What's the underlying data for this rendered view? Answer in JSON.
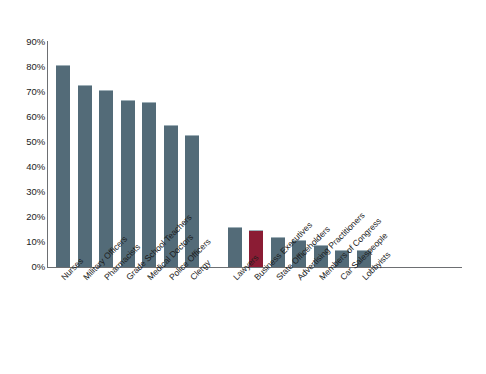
{
  "chart_data": {
    "type": "bar",
    "title": "",
    "subtitle": "",
    "xlabel": "",
    "ylabel": "",
    "ylim": [
      0,
      90
    ],
    "ytick_labels": [
      "90%",
      "80%",
      "70%",
      "60%",
      "50%",
      "40%",
      "30%",
      "20%",
      "10%",
      "0%"
    ],
    "ytick_values": [
      90,
      80,
      70,
      60,
      50,
      40,
      30,
      20,
      10,
      0
    ],
    "grid": false,
    "legend": "none",
    "categories": [
      "Nurses",
      "Military Officers",
      "Pharmacists",
      "Grade School Teachers",
      "Medical Doctors",
      "Police Officers",
      "Clergy",
      "Lawyers",
      "Business Executives",
      "State Officeholders",
      "Advertising Practitioners",
      "Members of Congress",
      "Car Salespeople",
      "Lobbyists"
    ],
    "values": [
      81,
      73,
      71,
      67,
      66,
      57,
      53,
      16,
      15,
      12,
      11,
      9,
      7,
      7
    ],
    "bar_colors": [
      "#536b78",
      "#536b78",
      "#536b78",
      "#536b78",
      "#536b78",
      "#536b78",
      "#536b78",
      "#536b78",
      "#8b1c34",
      "#536b78",
      "#536b78",
      "#536b78",
      "#536b78",
      "#536b78"
    ],
    "highlighted_category": "Business Executives",
    "group_break_after_index": 6
  },
  "colors": {
    "bar_default": "#536b78",
    "bar_highlight": "#8b1c34",
    "axis": "#6d6f72",
    "text": "#1c1c1c",
    "background": "#ffffff"
  }
}
